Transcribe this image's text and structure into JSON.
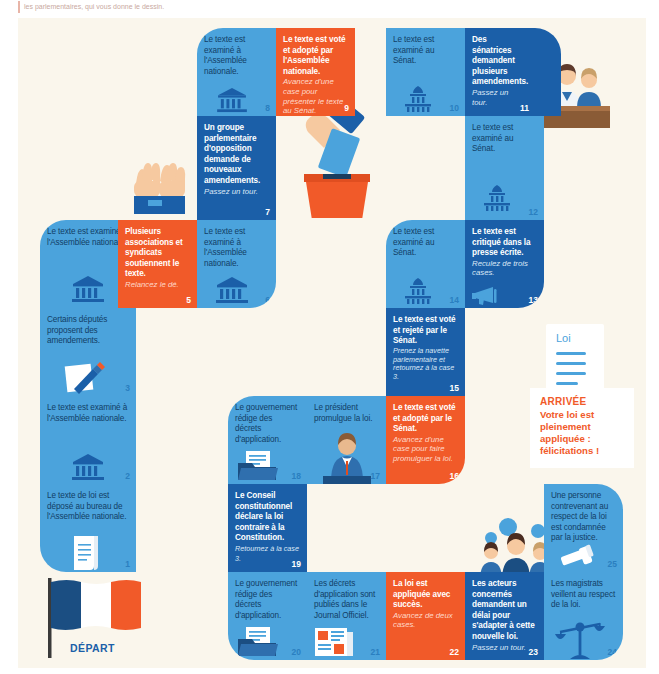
{
  "caption": "les parlementaires, qui vous donne le dessin.",
  "board": {
    "start_label": "DÉPART",
    "finish": {
      "title": "ARRIVÉE",
      "body": "Votre loi est pleinement appliquée : félicitations !"
    },
    "law_doc_label": "Loi",
    "colors": {
      "light_blue": "#4BA3DC",
      "dark_blue": "#1B5FA8",
      "orange": "#F15A29",
      "background": "#FAF6EC",
      "text_dark": "#123e66"
    }
  },
  "cells": [
    {
      "n": "1",
      "color": "light",
      "text": "Le texte de loi est déposé au bureau de l'Assemblée nationale.",
      "sub": "",
      "icon": "scroll-icon"
    },
    {
      "n": "2",
      "color": "light",
      "text": "Le texte est examiné à l'Assemblée nationale.",
      "sub": "",
      "icon": "assembly-icon"
    },
    {
      "n": "3",
      "color": "light",
      "text": "Certains députés proposent des amendements.",
      "sub": "",
      "icon": "pencil-paper-icon"
    },
    {
      "n": "4",
      "color": "light",
      "text": "Le texte est examiné à l'Assemblée nationale.",
      "sub": "",
      "icon": "assembly-icon"
    },
    {
      "n": "5",
      "color": "orange",
      "text": "Plusieurs associations et syndicats soutiennent le texte.",
      "sub": "Relancez le dé.",
      "icon": "none"
    },
    {
      "n": "6",
      "color": "light",
      "text": "Le texte est examiné à l'Assemblée nationale.",
      "sub": "",
      "icon": "assembly-icon"
    },
    {
      "n": "7",
      "color": "dark",
      "text": "Un groupe parlementaire d'opposition demande de nouveaux amendements.",
      "sub": "Passez un tour.",
      "icon": "none"
    },
    {
      "n": "8",
      "color": "light",
      "text": "Le texte est examiné à l'Assemblée nationale.",
      "sub": "",
      "icon": "assembly-icon"
    },
    {
      "n": "9",
      "color": "orange",
      "text": "Le texte est voté et adopté par l'Assemblée nationale.",
      "sub": "Avancez d'une case pour présenter le texte au Sénat.",
      "icon": "none"
    },
    {
      "n": "10",
      "color": "light",
      "text": "Le texte est examiné au Sénat.",
      "sub": "",
      "icon": "senate-icon"
    },
    {
      "n": "11",
      "color": "dark",
      "text": "Des sénatrices demandent plusieurs amendements.",
      "sub": "Passez un tour.",
      "icon": "none"
    },
    {
      "n": "12",
      "color": "light",
      "text": "Le texte est examiné au Sénat.",
      "sub": "",
      "icon": "senate-icon"
    },
    {
      "n": "13",
      "color": "dark",
      "text": "Le texte est critiqué dans la presse écrite.",
      "sub": "Reculez de trois cases.",
      "icon": "megaphone-icon"
    },
    {
      "n": "14",
      "color": "light",
      "text": "Le texte est examiné au Sénat.",
      "sub": "",
      "icon": "senate-icon"
    },
    {
      "n": "15",
      "color": "dark",
      "text": "Le texte est voté et rejeté par le Sénat.",
      "sub": "Prenez la navette parlementaire et retournez à la case 3.",
      "icon": "none"
    },
    {
      "n": "16",
      "color": "orange",
      "text": "Le texte est voté et adopté par le Sénat.",
      "sub": "Avancez d'une case pour faire promulguer la loi.",
      "icon": "none"
    },
    {
      "n": "17",
      "color": "light",
      "text": "Le président promulgue la loi.",
      "sub": "",
      "icon": "president-icon"
    },
    {
      "n": "18",
      "color": "light",
      "text": "Le gouvernement rédige des décrets d'application.",
      "sub": "",
      "icon": "folder-icon"
    },
    {
      "n": "19",
      "color": "dark",
      "text": "Le Conseil constitutionnel déclare la loi contraire à la Constitution.",
      "sub": "Retournez à la case 3.",
      "icon": "none"
    },
    {
      "n": "20",
      "color": "light",
      "text": "Le gouvernement rédige des décrets d'application.",
      "sub": "",
      "icon": "folder-icon"
    },
    {
      "n": "21",
      "color": "light",
      "text": "Les décrets d'application sont publiés dans le Journal Officiel.",
      "sub": "",
      "icon": "newspaper-icon"
    },
    {
      "n": "22",
      "color": "orange",
      "text": "La loi est appliquée avec succès.",
      "sub": "Avancez de deux cases.",
      "icon": "none"
    },
    {
      "n": "23",
      "color": "dark",
      "text": "Les acteurs concernés demandent un délai pour s'adapter à cette nouvelle loi.",
      "sub": "Passez un tour.",
      "icon": "none"
    },
    {
      "n": "24",
      "color": "light",
      "text": "Les magistrats veillent au respect de la loi.",
      "sub": "",
      "icon": "scales-icon"
    },
    {
      "n": "25",
      "color": "light",
      "text": "Une personne contrevenant au respect de la loi est condamnée par la justice.",
      "sub": "",
      "icon": "gavel-icon"
    }
  ],
  "illustrations": [
    {
      "name": "raised-hands-illustration"
    },
    {
      "name": "ballot-box-illustration"
    },
    {
      "name": "senators-podium-illustration"
    },
    {
      "name": "citizens-group-illustration"
    },
    {
      "name": "french-flag-illustration"
    }
  ]
}
